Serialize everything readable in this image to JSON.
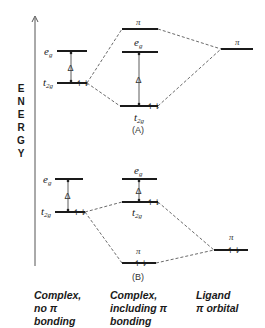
{
  "diagram": {
    "type": "molecular orbital energy level diagram",
    "axis": {
      "label": "ENERGY",
      "letters": [
        "E",
        "N",
        "E",
        "R",
        "G",
        "Y"
      ]
    },
    "labels": {
      "eg": "e",
      "eg_sub": "g",
      "t2g": "t",
      "t2g_sub": "2g",
      "pi": "π",
      "delta": "Δ",
      "electrons": "↿⇂"
    },
    "panels": {
      "A": {
        "tag": "(A)"
      },
      "B": {
        "tag": "(B)"
      }
    },
    "columns": [
      {
        "lines": [
          "Complex,",
          "no π",
          "bonding"
        ]
      },
      {
        "lines": [
          "Complex,",
          "including π",
          "bonding"
        ]
      },
      {
        "lines": [
          "Ligand",
          "π orbital"
        ]
      }
    ]
  }
}
